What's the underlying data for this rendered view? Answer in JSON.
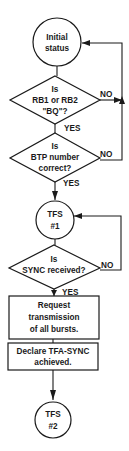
{
  "diagram": {
    "type": "flowchart",
    "colors": {
      "stroke": "#1a1a1a",
      "background": "#ffffff"
    },
    "nodes": {
      "initial_status": {
        "shape": "circle",
        "lines": [
          "Initial",
          "status"
        ]
      },
      "decision_rb": {
        "shape": "diamond",
        "lines": [
          "Is",
          "RB1 or RB2",
          "\"BQ\"?"
        ]
      },
      "decision_btp": {
        "shape": "diamond",
        "lines": [
          "Is",
          "BTP number",
          "correct?"
        ]
      },
      "tfs1": {
        "shape": "circle",
        "lines": [
          "TFS",
          "#1"
        ]
      },
      "decision_sync": {
        "shape": "diamond",
        "lines": [
          "Is",
          "SYNC received?"
        ]
      },
      "request_box": {
        "shape": "rect",
        "lines": [
          "Request",
          "transmission",
          "of all bursts."
        ]
      },
      "declare_box": {
        "shape": "rect",
        "lines": [
          "Declare TFA-SYNC",
          "achieved."
        ]
      },
      "tfs2": {
        "shape": "circle",
        "lines": [
          "TFS",
          "#2"
        ]
      }
    },
    "edge_labels": {
      "rb_no": "NO",
      "rb_yes": "YES",
      "btp_no": "NO",
      "btp_yes": "YES",
      "sync_no": "NO",
      "sync_yes": "YES"
    },
    "edges": [
      {
        "from": "initial_status",
        "to": "decision_rb"
      },
      {
        "from": "decision_rb",
        "to": "initial_status",
        "label": "NO"
      },
      {
        "from": "decision_rb",
        "to": "decision_btp",
        "label": "YES"
      },
      {
        "from": "decision_btp",
        "to": "initial_status",
        "label": "NO"
      },
      {
        "from": "decision_btp",
        "to": "tfs1",
        "label": "YES"
      },
      {
        "from": "tfs1",
        "to": "decision_sync"
      },
      {
        "from": "decision_sync",
        "to": "tfs1",
        "label": "NO"
      },
      {
        "from": "decision_sync",
        "to": "request_box",
        "label": "YES"
      },
      {
        "from": "request_box",
        "to": "declare_box"
      },
      {
        "from": "declare_box",
        "to": "tfs2"
      }
    ]
  }
}
